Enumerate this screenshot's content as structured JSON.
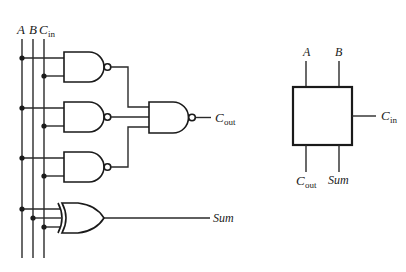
{
  "circuit": {
    "title": "Full adder (gate-level)",
    "inputs": [
      {
        "name": "A",
        "sub": "",
        "x": 22
      },
      {
        "name": "B",
        "sub": "",
        "x": 33
      },
      {
        "name": "C",
        "sub": "in",
        "x": 44
      }
    ],
    "nand_gates": [
      {
        "id": "nand1",
        "inputs": [
          "A",
          "Cin"
        ],
        "y_top": 52
      },
      {
        "id": "nand2",
        "inputs": [
          "A",
          "Cin"
        ],
        "y_top": 102
      },
      {
        "id": "nand3",
        "inputs": [
          "A",
          "Cin"
        ],
        "y_top": 152
      }
    ],
    "output_nand": {
      "id": "nand-out",
      "inputs": 3
    },
    "xor_gate": {
      "id": "xor",
      "inputs": [
        "A",
        "B",
        "Cin"
      ]
    },
    "outputs": {
      "cout": {
        "main": "C",
        "sub": "out"
      },
      "sum": {
        "label": "Sum"
      }
    }
  },
  "block": {
    "title": "Full adder block symbol",
    "top_inputs": [
      {
        "label": "A"
      },
      {
        "label": "B"
      }
    ],
    "right_input": {
      "main": "C",
      "sub": "in"
    },
    "bottom_outputs": [
      {
        "main": "C",
        "sub": "out"
      },
      {
        "label": "Sum"
      }
    ]
  },
  "labels": {
    "A": "A",
    "B": "B",
    "C": "C",
    "in": "in",
    "out": "out",
    "Sum": "Sum"
  }
}
